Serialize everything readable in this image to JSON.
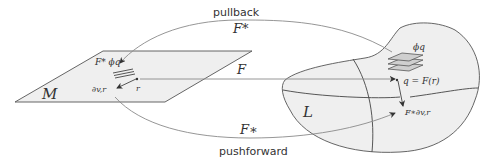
{
  "diagram": {
    "manifold_M": {
      "label": "M"
    },
    "manifold_L": {
      "label": "L"
    },
    "arrows": {
      "pullback": {
        "caption": "pullback",
        "symbol": "F*"
      },
      "map": {
        "symbol": "F"
      },
      "pushforward": {
        "caption": "pushforward",
        "symbol": "F∗"
      }
    },
    "labels": {
      "pulled_form": "F* ϕq",
      "point_r": "r",
      "vector_on_M": "∂v,r",
      "form_on_L": "ϕq",
      "point_q": "q = F(r)",
      "pushed_vector": "F∗∂v,r"
    },
    "colors": {
      "surface_fill": "#efefef",
      "sheet_fill": "#cfcfcf",
      "curve_stroke": "#8a8a8a",
      "edge_stroke": "#444444",
      "text": "#333333"
    }
  }
}
